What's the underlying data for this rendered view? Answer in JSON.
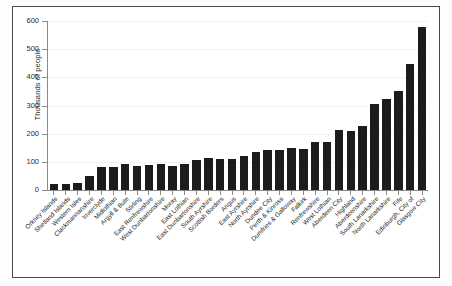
{
  "chart_data": {
    "type": "bar",
    "title": "",
    "xlabel": "",
    "ylabel": "Thousands of people",
    "ylim": [
      0,
      600
    ],
    "yticks": [
      0,
      100,
      200,
      300,
      400,
      500,
      600
    ],
    "grid": true,
    "legend": null,
    "bar_color": "#1c1c1c",
    "categories": [
      "Orkney Islands",
      "Shetland Islands",
      "Western Isles",
      "Clackmannanshire",
      "Inverclyde",
      "Midlothian",
      "Argyll & Bute",
      "Stirling",
      "East Renfrewshire",
      "West Dunbartonshire",
      "Moray",
      "East Lothian",
      "East Dunbartonshire",
      "South Ayrshire",
      "Scottish Borders",
      "Angus",
      "East Ayrshire",
      "North Ayrshire",
      "Dundee City",
      "Perth & Kinross",
      "Dumfries & Galloway",
      "Falkirk",
      "Renfrewshire",
      "West Lothian",
      "Aberdeen City",
      "Highland",
      "Aberdeenshire",
      "South Lanarkshire",
      "North Lanarkshire",
      "Fife",
      "Edinburgh, City of",
      "Glasgow City"
    ],
    "values": [
      20,
      22,
      26,
      48,
      80,
      82,
      91,
      87,
      89,
      91,
      87,
      91,
      108,
      112,
      110,
      111,
      120,
      136,
      142,
      142,
      148,
      146,
      171,
      172,
      212,
      209,
      226,
      307,
      324,
      352,
      448,
      577
    ],
    "units": "thousands of people"
  },
  "axis": {
    "ylabel": "Thousands of people",
    "ytick_labels": [
      "0",
      "100",
      "200",
      "300",
      "400",
      "500",
      "600"
    ]
  }
}
